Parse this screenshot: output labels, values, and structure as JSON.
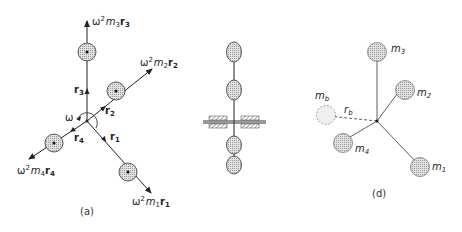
{
  "figure": {
    "panels": [
      {
        "id": "a",
        "caption": "(a)",
        "description": "Force vector diagram of four rotating masses",
        "labels": {
          "omega": "ω",
          "r1": "r",
          "r1_sub": "1",
          "r2": "r",
          "r2_sub": "2",
          "r3": "r",
          "r3_sub": "3",
          "r4": "r",
          "r4_sub": "4",
          "f1": {
            "w": "ω",
            "exp": "2",
            "m": "m",
            "msub": "1",
            "r": "r",
            "rsub": "1"
          },
          "f2": {
            "w": "ω",
            "exp": "2",
            "m": "m",
            "msub": "2",
            "r": "r",
            "rsub": "2"
          },
          "f3": {
            "w": "ω",
            "exp": "2",
            "m": "m",
            "msub": "3",
            "r": "r",
            "rsub": "3"
          },
          "f4": {
            "w": "ω",
            "exp": "2",
            "m": "m",
            "msub": "4",
            "r": "r",
            "rsub": "4"
          }
        }
      },
      {
        "id": "b",
        "caption": "",
        "description": "Side view of shaft with four masses and bearings"
      },
      {
        "id": "d",
        "caption": "(d)",
        "description": "Balancing mass diagram",
        "labels": {
          "m1": "m",
          "m1_sub": "1",
          "m2": "m",
          "m2_sub": "2",
          "m3": "m",
          "m3_sub": "3",
          "m4": "m",
          "m4_sub": "4",
          "mb": "m",
          "mb_sub": "b",
          "rb": "r",
          "rb_sub": "b"
        }
      }
    ],
    "colors": {
      "line": "#222222",
      "mass_fill": "#d4d4d4",
      "background": "#ffffff"
    }
  }
}
